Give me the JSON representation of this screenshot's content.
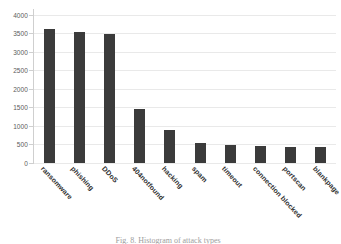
{
  "figure": {
    "caption": "Fig. 8. Histogram of attack types",
    "background_color": "#ffffff"
  },
  "chart_data": {
    "type": "bar",
    "title": "",
    "xlabel": "",
    "ylabel": "",
    "categories": [
      "ransomware",
      "phishing",
      "DDoS",
      "404notfound",
      "hacking",
      "spam",
      "timeout",
      "connection blocked",
      "portscan",
      "blankpage"
    ],
    "values": [
      3600,
      3530,
      3490,
      1450,
      900,
      540,
      490,
      455,
      440,
      420
    ],
    "ylim": [
      0,
      4150
    ],
    "yticks": [
      0,
      500,
      1000,
      1500,
      2000,
      2500,
      3000,
      3500,
      4000
    ],
    "ytick_labels": [
      "0",
      "500",
      "1000",
      "1500",
      "2000",
      "2500",
      "3000",
      "3500",
      "4000"
    ],
    "grid": true,
    "grid_axis": "y",
    "legend": null,
    "bar_color": "#3b3b3b",
    "grid_color": "#e9e9e9",
    "axis_color": "#cfcfcf",
    "tick_label_color": "#5b5b5b",
    "xtick_rotation": 47
  }
}
